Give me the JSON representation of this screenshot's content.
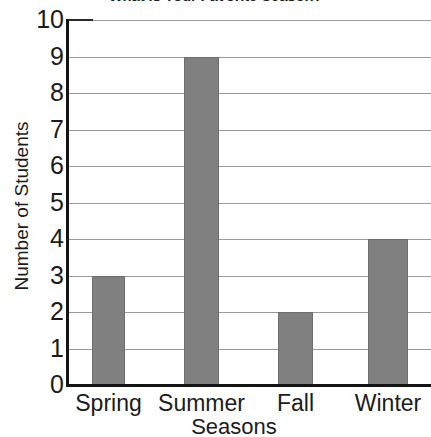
{
  "chart_data": {
    "type": "bar",
    "title": "What is Your Favorite Season?",
    "xlabel": "Seasons",
    "ylabel": "Number of Students",
    "categories": [
      "Spring",
      "Summer",
      "Fall",
      "Winter"
    ],
    "values": [
      3,
      9,
      2,
      4
    ],
    "ylim": [
      0,
      10
    ],
    "ytick_labels": [
      "10",
      "9",
      "8",
      "7",
      "6",
      "5",
      "4",
      "3",
      "2",
      "1",
      "0"
    ],
    "ytick_values": [
      10,
      9,
      8,
      7,
      6,
      5,
      4,
      3,
      2,
      1,
      0
    ],
    "grid": true,
    "grid_axis": "y",
    "legend": false,
    "bar_color": "#808080",
    "bar_edge_color": "#6d6d6d",
    "grid_color": "#9a9a9a",
    "axis_color": "#141414",
    "text_color": "#1b1b1b",
    "background_color": "#ffffff"
  }
}
